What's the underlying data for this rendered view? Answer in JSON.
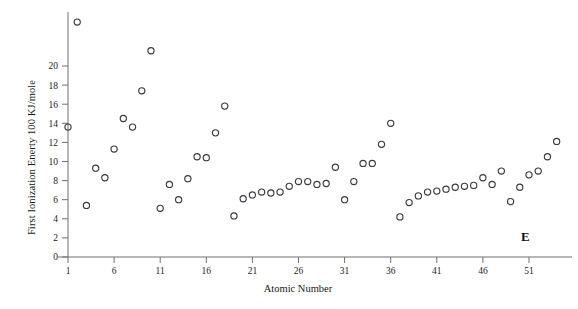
{
  "chart_data": {
    "type": "scatter",
    "title": "",
    "xlabel": "Atomic Number",
    "ylabel": "First Ionization Enerty  100 KJ/mole",
    "xlim": [
      0,
      56
    ],
    "ylim": [
      0,
      26
    ],
    "xticks": [
      1,
      6,
      11,
      16,
      21,
      26,
      31,
      36,
      41,
      46,
      51
    ],
    "yticks": [
      0,
      2,
      4,
      6,
      8,
      10,
      12,
      14,
      16,
      18,
      20
    ],
    "grid": false,
    "legend": null,
    "annotations": [
      {
        "text": "E",
        "x": 53,
        "y": 2.0,
        "bold": true
      }
    ],
    "marker": "open-circle",
    "marker_color": "#3a3a42",
    "x": [
      1,
      2,
      3,
      4,
      5,
      6,
      7,
      8,
      9,
      10,
      11,
      12,
      13,
      14,
      15,
      16,
      17,
      18,
      19,
      20,
      21,
      22,
      23,
      24,
      25,
      26,
      27,
      28,
      29,
      30,
      31,
      32,
      33,
      34,
      35,
      36,
      37,
      38,
      39,
      40,
      41,
      42,
      43,
      44,
      45,
      46,
      47,
      48,
      49,
      50,
      51,
      52,
      53,
      54
    ],
    "values": [
      13.6,
      24.6,
      5.4,
      9.3,
      8.3,
      11.3,
      14.5,
      13.6,
      17.4,
      21.6,
      5.1,
      7.6,
      6.0,
      8.2,
      10.5,
      10.4,
      13.0,
      15.8,
      4.3,
      6.1,
      6.5,
      6.8,
      6.7,
      6.8,
      7.4,
      7.9,
      7.9,
      7.6,
      7.7,
      9.4,
      6.0,
      7.9,
      9.8,
      9.8,
      11.8,
      14.0,
      4.2,
      5.7,
      6.4,
      6.8,
      6.9,
      7.1,
      7.3,
      7.4,
      7.5,
      8.3,
      7.6,
      9.0,
      5.8,
      7.3,
      8.6,
      9.0,
      10.5,
      12.1
    ]
  },
  "axes": {
    "x_title": "Atomic Number",
    "y_title": "First Ionization Enerty  100 KJ/mole",
    "x_tick_labels": [
      "1",
      "6",
      "11",
      "16",
      "21",
      "26",
      "31",
      "36",
      "41",
      "46",
      "51"
    ],
    "y_tick_labels": [
      "0",
      "2",
      "4",
      "6",
      "8",
      "10",
      "12",
      "14",
      "16",
      "18",
      "20"
    ]
  },
  "annotation": {
    "corner_label": "E"
  },
  "colors": {
    "marker": "#3a3a42",
    "axis": "#6f7073",
    "text": "#18181a",
    "background": "#ffffff"
  }
}
